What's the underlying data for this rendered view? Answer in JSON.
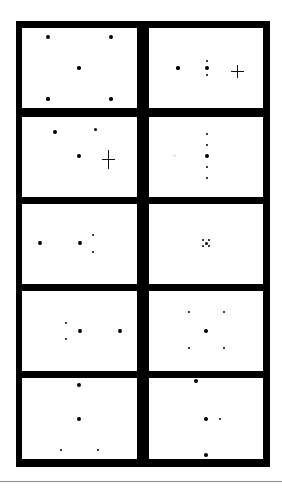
{
  "figure": {
    "frame_color": "#000000",
    "panel_color": "#ffffff",
    "dot_color": "#000000",
    "rule_color": "#8a8a8a",
    "frame": {
      "x": 16,
      "y": 21,
      "w": 254,
      "h": 446
    },
    "rule_y": 481,
    "columns": [
      {
        "x": 22,
        "w": 115
      },
      {
        "x": 149,
        "w": 114
      }
    ],
    "rows": [
      {
        "y": 28,
        "h": 80
      },
      {
        "y": 117,
        "h": 80
      },
      {
        "y": 204,
        "h": 80
      },
      {
        "y": 291,
        "h": 80
      },
      {
        "y": 378,
        "h": 81
      }
    ],
    "panels": [
      {
        "id": "r1-left",
        "label": "",
        "dots": [
          {
            "x": 48,
            "y": 37,
            "r": 2.3
          },
          {
            "x": 111,
            "y": 37,
            "r": 2.3
          },
          {
            "x": 79,
            "y": 68,
            "r": 1.8
          },
          {
            "x": 48,
            "y": 99,
            "r": 1.8
          },
          {
            "x": 111,
            "y": 99,
            "r": 1.8
          }
        ],
        "crosses": []
      },
      {
        "id": "r1-right",
        "label": "",
        "dots": [
          {
            "x": 178,
            "y": 68,
            "r": 1.6
          },
          {
            "x": 207,
            "y": 61,
            "r": 1.4
          },
          {
            "x": 207,
            "y": 68,
            "r": 1.9
          },
          {
            "x": 207,
            "y": 75,
            "r": 1.4
          }
        ],
        "crosses": [
          {
            "x": 237,
            "y": 71,
            "w": 13,
            "h": 13
          }
        ]
      },
      {
        "id": "r2-left",
        "label": "",
        "dots": [
          {
            "x": 55,
            "y": 132,
            "r": 1.9
          },
          {
            "x": 95,
            "y": 129,
            "r": 1.5
          },
          {
            "x": 79,
            "y": 156,
            "r": 1.9
          }
        ],
        "crosses": [
          {
            "x": 108,
            "y": 159,
            "w": 13,
            "h": 19
          }
        ]
      },
      {
        "id": "r2-right",
        "label": "",
        "dots": [
          {
            "x": 207,
            "y": 134,
            "r": 1.4
          },
          {
            "x": 207,
            "y": 145,
            "r": 1.4
          },
          {
            "x": 207,
            "y": 156,
            "r": 1.9
          },
          {
            "x": 207,
            "y": 167,
            "r": 1.4
          },
          {
            "x": 207,
            "y": 178,
            "r": 1.4
          }
        ],
        "crosses": [],
        "smudges": [
          {
            "x": 174,
            "y": 155,
            "r": 1.5
          }
        ]
      },
      {
        "id": "r3-left",
        "label": "",
        "dots": [
          {
            "x": 40,
            "y": 243,
            "r": 1.9
          },
          {
            "x": 80,
            "y": 243,
            "r": 1.9
          },
          {
            "x": 93,
            "y": 235,
            "r": 1.4
          },
          {
            "x": 93,
            "y": 252,
            "r": 1.4
          }
        ],
        "crosses": []
      },
      {
        "id": "r3-right",
        "label": "",
        "dots": [
          {
            "x": 203,
            "y": 240,
            "r": 1.3
          },
          {
            "x": 209,
            "y": 240,
            "r": 1.3
          },
          {
            "x": 206,
            "y": 243,
            "r": 1.5
          },
          {
            "x": 203,
            "y": 246,
            "r": 1.3
          },
          {
            "x": 209,
            "y": 246,
            "r": 1.3
          }
        ],
        "crosses": []
      },
      {
        "id": "r4-left",
        "label": "",
        "dots": [
          {
            "x": 66,
            "y": 323,
            "r": 1.4
          },
          {
            "x": 80,
            "y": 331,
            "r": 1.9
          },
          {
            "x": 120,
            "y": 331,
            "r": 1.9
          },
          {
            "x": 66,
            "y": 339,
            "r": 1.4
          }
        ],
        "crosses": []
      },
      {
        "id": "r4-right",
        "label": "",
        "dots": [
          {
            "x": 189,
            "y": 312,
            "r": 1.4
          },
          {
            "x": 224,
            "y": 312,
            "r": 1.4
          },
          {
            "x": 206,
            "y": 331,
            "r": 1.9
          },
          {
            "x": 189,
            "y": 348,
            "r": 1.4
          },
          {
            "x": 224,
            "y": 348,
            "r": 1.4
          }
        ],
        "crosses": []
      },
      {
        "id": "r5-left",
        "label": "",
        "dots": [
          {
            "x": 79,
            "y": 385,
            "r": 1.9
          },
          {
            "x": 79,
            "y": 419,
            "r": 1.9
          },
          {
            "x": 61,
            "y": 450,
            "r": 1.4
          },
          {
            "x": 98,
            "y": 450,
            "r": 1.4
          }
        ],
        "crosses": []
      },
      {
        "id": "r5-right",
        "label": "",
        "dots": [
          {
            "x": 196,
            "y": 381,
            "r": 2.0
          },
          {
            "x": 206,
            "y": 419,
            "r": 1.9
          },
          {
            "x": 220,
            "y": 419,
            "r": 1.4
          },
          {
            "x": 206,
            "y": 455,
            "r": 1.9
          }
        ],
        "crosses": []
      }
    ]
  }
}
